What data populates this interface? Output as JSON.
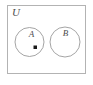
{
  "diagram": {
    "type": "venn",
    "universe": {
      "label": "U",
      "shape": "rectangle",
      "border_color": "#b0b0b0",
      "fill_color": "#ffffff"
    },
    "sets": [
      {
        "name": "set-a",
        "label": "A",
        "shape": "circle",
        "border_color": "#9a9a9a",
        "fill_color": "#ffffff",
        "cx": 29.5,
        "cy": 42,
        "r": 14.5
      },
      {
        "name": "set-b",
        "label": "B",
        "shape": "circle",
        "border_color": "#9a9a9a",
        "fill_color": "#ffffff",
        "cx": 65,
        "cy": 42,
        "r": 15
      }
    ],
    "elements": [
      {
        "name": "element-marker",
        "shape": "square",
        "color": "#1a1a1a",
        "member_of": "A",
        "x": 33.5,
        "y": 45.5,
        "size": 3.5
      }
    ],
    "label_positions": {
      "universe": {
        "x": 12,
        "y": 16
      },
      "set_a": {
        "x": 31.5,
        "y": 37
      },
      "set_b": {
        "x": 65.5,
        "y": 35.5
      }
    },
    "frame": {
      "x": 7.5,
      "y": 5.5,
      "width": 78,
      "height": 68
    }
  }
}
